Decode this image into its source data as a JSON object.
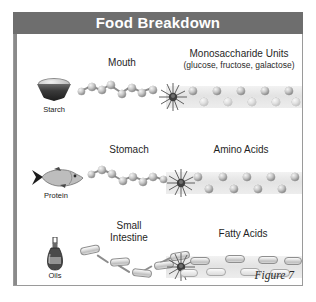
{
  "figure": {
    "title": "Food Breakdown",
    "caption": "Figure 7",
    "accent_color": "#6e6e6e",
    "frame_border_color": "#9a9a9a",
    "background_color": "#ffffff"
  },
  "rows": [
    {
      "id": "carbohydrate",
      "source_label": "Starch",
      "source_icon": "bowl-of-starch-icon",
      "process_label": "Mouth",
      "product_label": "Monosaccharide Units",
      "product_sublabel": "(glucose, fructose, galactose)",
      "breakdown_icon": "starburst-icon",
      "chain_unit_shape": "sphere",
      "product_unit_shape": "sphere",
      "product_units_top": 5,
      "product_units_bottom": 5
    },
    {
      "id": "protein",
      "source_label": "Protein",
      "source_icon": "fish-icon",
      "process_label": "Stomach",
      "product_label": "Amino Acids",
      "product_sublabel": "",
      "breakdown_icon": "starburst-icon",
      "chain_unit_shape": "sphere",
      "product_unit_shape": "sphere",
      "product_units_top": 5,
      "product_units_bottom": 4
    },
    {
      "id": "lipid",
      "source_label": "Oils",
      "source_icon": "oil-bottle-icon",
      "process_label": "Small\nIntestine",
      "process_label_line1": "Small",
      "process_label_line2": "Intestine",
      "product_label": "Fatty Acids",
      "product_sublabel": "",
      "breakdown_icon": "starburst-icon",
      "chain_unit_shape": "capsule",
      "product_unit_shape": "capsule",
      "product_units_top": 4,
      "product_units_bottom": 4
    }
  ]
}
